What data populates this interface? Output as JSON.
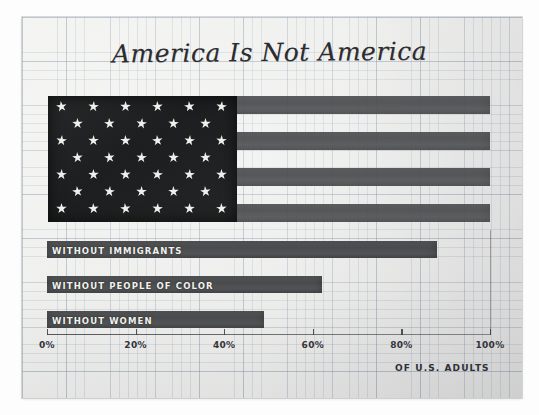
{
  "chart_data": {
    "type": "bar",
    "title": "America Is Not America",
    "xlabel": "OF U.S. ADULTS",
    "ylabel": "",
    "xlim": [
      0,
      100
    ],
    "grid": true,
    "legend": "none",
    "orientation": "horizontal",
    "unit": "%",
    "categories": [
      "WITHOUT IMMIGRANTS",
      "WITHOUT PEOPLE OF COLOR",
      "WITHOUT WOMEN"
    ],
    "values": [
      88,
      62,
      49
    ],
    "tick_labels": [
      "0%",
      "20%",
      "40%",
      "60%",
      "80%",
      "100%"
    ],
    "tick_values": [
      0,
      20,
      40,
      60,
      80,
      100
    ],
    "annotations": [
      "Top graphic is a United States flag drawn as a full-width 100% reference bar"
    ],
    "flag": {
      "name": "us-flag-reference-bar",
      "stripe_count": 7,
      "dark_stripe_count": 4,
      "star_row_counts": [
        6,
        5,
        6,
        5,
        6,
        5,
        6
      ],
      "star_count": 39,
      "span_percent": 100,
      "canton_percent": 43
    },
    "colors": {
      "bar": "#4e5052",
      "flag_stripe": "#535557",
      "flag_canton": "#212223",
      "star": "#f0efeb",
      "paper": "#eeefed",
      "grid": "#8fa0b4",
      "ink": "#2d2d30"
    }
  },
  "title": {
    "text": "America Is Not America"
  },
  "axis": {
    "caption": "OF U.S. ADULTS",
    "ticks": [
      {
        "label": "0%",
        "value": 0
      },
      {
        "label": "20%",
        "value": 20
      },
      {
        "label": "40%",
        "value": 40
      },
      {
        "label": "60%",
        "value": 60
      },
      {
        "label": "80%",
        "value": 80
      },
      {
        "label": "100%",
        "value": 100
      }
    ]
  },
  "bars": [
    {
      "label": "WITHOUT IMMIGRANTS",
      "value": 88
    },
    {
      "label": "WITHOUT PEOPLE OF COLOR",
      "value": 62
    },
    {
      "label": "WITHOUT WOMEN",
      "value": 49
    }
  ]
}
